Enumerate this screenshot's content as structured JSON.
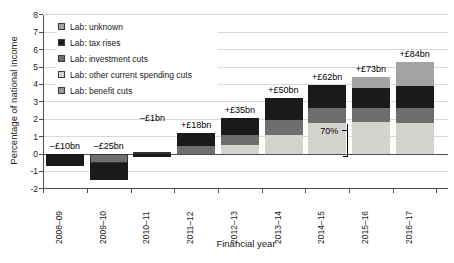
{
  "figure": {
    "xaxis_title": "Financial year",
    "yaxis_title": "Percentage of national income"
  },
  "chart_data": {
    "type": "bar",
    "stacked": true,
    "title": "",
    "xlabel": "Financial year",
    "ylabel": "Percentage of national income",
    "ylim": [
      -2,
      8
    ],
    "grid": true,
    "legend_position": "top-left-inside",
    "yticks": [
      8,
      7,
      6,
      5,
      4,
      3,
      2,
      1,
      0,
      -1,
      -2
    ],
    "categories": [
      "2008–09",
      "2009–10",
      "2010–11",
      "2011–12",
      "2012–13",
      "2013–14",
      "2014–15",
      "2015–16",
      "2016–17"
    ],
    "series_order_bottom_to_top": [
      "benefit_cuts",
      "other_current_spending_cuts",
      "investment_cuts",
      "tax_rises",
      "unknown"
    ],
    "legend": [
      {
        "key": "unknown",
        "label": "Lab: unknown"
      },
      {
        "key": "tax_rises",
        "label": "Lab: tax rises"
      },
      {
        "key": "investment_cuts",
        "label": "Lab: investment cuts"
      },
      {
        "key": "other_current_spending_cuts",
        "label": "Lab: other current spending cuts"
      },
      {
        "key": "benefit_cuts",
        "label": "Lab: benefit cuts"
      }
    ],
    "colors": {
      "unknown": "#a3a3a3",
      "tax_rises": "#1a1a1a",
      "investment_cuts": "#6e6e6e",
      "other_current_spending_cuts": "#d5d3ce",
      "benefit_cuts": "#999999",
      "segment_border": "#333333",
      "gridline": "#d9d9d9",
      "axis": "#4d4d4d"
    },
    "bars": [
      {
        "year": "2008–09",
        "total_label": "–£10bn",
        "segments": [
          {
            "key": "tax_rises",
            "value": -0.7
          }
        ]
      },
      {
        "year": "2009–10",
        "total_label": "–£25bn",
        "segments": [
          {
            "key": "investment_cuts",
            "value": -0.5,
            "bordered": true
          },
          {
            "key": "tax_rises",
            "value": -1.0
          }
        ]
      },
      {
        "year": "2010–11",
        "total_label": "–£1bn",
        "label_offset_y": -26,
        "segments": [
          {
            "key": "benefit_cuts",
            "value": 0.1,
            "bordered": true
          },
          {
            "key": "tax_rises",
            "value": -0.2
          }
        ]
      },
      {
        "year": "2011–12",
        "total_label": "+£18bn",
        "segments": [
          {
            "key": "investment_cuts",
            "value": 0.45
          },
          {
            "key": "tax_rises",
            "value": 0.75
          }
        ]
      },
      {
        "year": "2012–13",
        "total_label": "+£35bn",
        "segments": [
          {
            "key": "other_current_spending_cuts",
            "value": 0.5
          },
          {
            "key": "investment_cuts",
            "value": 0.6
          },
          {
            "key": "tax_rises",
            "value": 0.95
          }
        ]
      },
      {
        "year": "2013–14",
        "total_label": "+£50bn",
        "segments": [
          {
            "key": "other_current_spending_cuts",
            "value": 1.1
          },
          {
            "key": "investment_cuts",
            "value": 0.85
          },
          {
            "key": "tax_rises",
            "value": 1.25
          }
        ]
      },
      {
        "year": "2014–15",
        "total_label": "+£62bn",
        "segments": [
          {
            "key": "other_current_spending_cuts",
            "value": 1.78
          },
          {
            "key": "investment_cuts",
            "value": 0.86
          },
          {
            "key": "tax_rises",
            "value": 1.33
          }
        ]
      },
      {
        "year": "2015–16",
        "total_label": "+£73bn",
        "segments": [
          {
            "key": "other_current_spending_cuts",
            "value": 1.86
          },
          {
            "key": "investment_cuts",
            "value": 0.77
          },
          {
            "key": "tax_rises",
            "value": 1.15
          },
          {
            "key": "unknown",
            "value": 0.66
          }
        ]
      },
      {
        "year": "2016–17",
        "total_label": "+£84bn",
        "segments": [
          {
            "key": "other_current_spending_cuts",
            "value": 1.78
          },
          {
            "key": "investment_cuts",
            "value": 0.85
          },
          {
            "key": "tax_rises",
            "value": 1.26
          },
          {
            "key": "unknown",
            "value": 1.41
          }
        ]
      }
    ],
    "annotation": {
      "text": "70%",
      "year": "2014–15"
    }
  }
}
